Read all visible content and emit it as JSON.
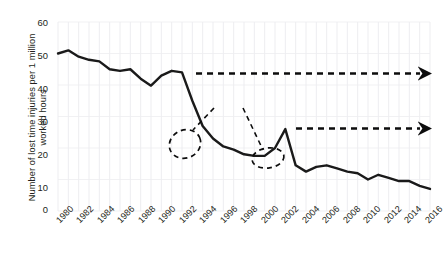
{
  "chart_data": {
    "type": "line",
    "title": "",
    "xlabel": "",
    "ylabel": "Number of lost time injuries per 1 million worked hours",
    "xlim": [
      1980,
      2016
    ],
    "ylim": [
      0,
      60
    ],
    "grid": true,
    "legend_position": "none",
    "ytick_labels": [
      "0",
      "10",
      "20",
      "30",
      "40",
      "50",
      "60"
    ],
    "ytick_values": [
      0,
      10,
      20,
      30,
      40,
      50,
      60
    ],
    "xtick_labels": [
      "1980",
      "1982",
      "1984",
      "1986",
      "1988",
      "1990",
      "1992",
      "1994",
      "1996",
      "1998",
      "2000",
      "2002",
      "2004",
      "2006",
      "2008",
      "2010",
      "2012",
      "2014",
      "2016"
    ],
    "xtick_values": [
      1980,
      1982,
      1984,
      1986,
      1988,
      1990,
      1992,
      1994,
      1996,
      1998,
      2000,
      2002,
      2004,
      2006,
      2008,
      2010,
      2012,
      2014,
      2016
    ],
    "series": [
      {
        "name": "Lost time injury rate",
        "color": "#1a1a1a",
        "x": [
          1980,
          1981,
          1982,
          1983,
          1984,
          1985,
          1986,
          1987,
          1988,
          1989,
          1990,
          1991,
          1992,
          1993,
          1994,
          1995,
          1996,
          1997,
          1998,
          1999,
          2000,
          2001,
          2002,
          2003,
          2004,
          2005,
          2006,
          2007,
          2008,
          2009,
          2010,
          2011,
          2012,
          2013,
          2014,
          2015,
          2016
        ],
        "values": [
          50.0,
          51.0,
          49.0,
          48.0,
          47.5,
          45.0,
          44.5,
          45.0,
          42.0,
          39.8,
          43.0,
          44.5,
          44.0,
          35.0,
          27.0,
          23.0,
          20.5,
          19.5,
          18.0,
          17.5,
          17.5,
          20.0,
          26.0,
          14.5,
          12.5,
          14.0,
          14.5,
          13.5,
          12.5,
          12.0,
          10.0,
          11.5,
          10.5,
          9.5,
          9.5,
          8.0,
          7.0
        ]
      }
    ],
    "annotations": [
      {
        "name": "technology-development",
        "label": "Technology development",
        "style": "dashed-arrow"
      },
      {
        "name": "legislation",
        "label": "Legislation",
        "style": "dashed-pointer"
      },
      {
        "name": "organisation",
        "label": "Organisation etc.",
        "style": "dashed-arrow"
      }
    ]
  },
  "annotation_labels": {
    "technology": "Technology development",
    "legislation": "Legislation",
    "organisation": "Organisation etc."
  },
  "axis": {
    "y_title": "Number of lost time injuries per 1 million worked hours"
  }
}
